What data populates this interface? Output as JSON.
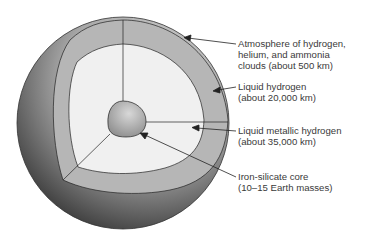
{
  "diagram": {
    "type": "cutaway-planet-interior",
    "layers": [
      {
        "id": "atmosphere",
        "lines": [
          "Atmosphere of hydrogen,",
          "helium, and ammonia",
          "clouds (about 500 km)"
        ]
      },
      {
        "id": "liquid-hydrogen",
        "lines": [
          "Liquid hydrogen",
          "(about 20,000 km)"
        ]
      },
      {
        "id": "liquid-metallic-hydrogen",
        "lines": [
          "Liquid metallic hydrogen",
          "(about 35,000 km)"
        ]
      },
      {
        "id": "core",
        "lines": [
          "Iron-silicate core",
          "(10–15 Earth masses)"
        ]
      }
    ],
    "colors": {
      "outer_shell_light": "#d8d8d8",
      "outer_shell_dark": "#3c3c3c",
      "liquid_hydrogen": "#b4b4b4",
      "metallic_hydrogen": "#efefef",
      "core": "#b0b0b0",
      "outline": "#222222",
      "text": "#3a3a3a"
    }
  }
}
